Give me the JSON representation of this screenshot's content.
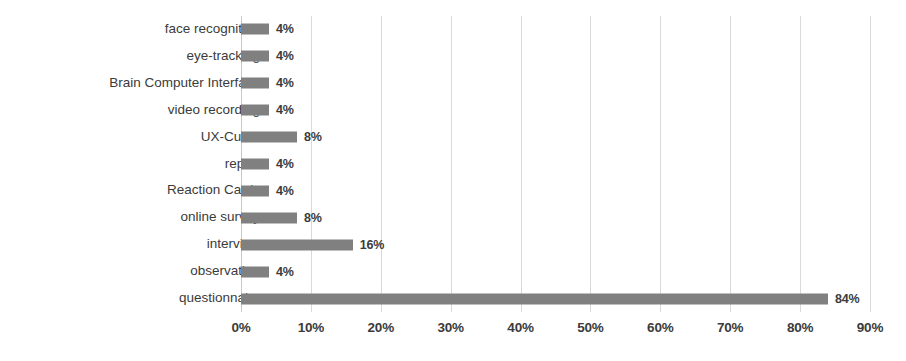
{
  "chart_data": {
    "type": "bar",
    "orientation": "horizontal",
    "title": "",
    "subtitle": "",
    "xlabel": "",
    "ylabel": "",
    "xlim": [
      0,
      90
    ],
    "xtick_step": 10,
    "grid": true,
    "legend": false,
    "legend_position": "none",
    "value_suffix": "%",
    "bar_color": "#808080",
    "gridline_color": "#d9d9d9",
    "background_color": "#ffffff",
    "text_color": "#3b3b3b",
    "categories": [
      "face recognition",
      "eye-tracking",
      "Brain Computer Interface",
      "video recording",
      "UX-Curve",
      "report",
      "Reaction Cards",
      "online survey",
      "interview",
      "observation",
      "questionnaire"
    ],
    "values": [
      4,
      4,
      4,
      4,
      8,
      4,
      4,
      8,
      16,
      4,
      84
    ],
    "value_labels": [
      "4%",
      "4%",
      "4%",
      "4%",
      "8%",
      "4%",
      "4%",
      "8%",
      "16%",
      "4%",
      "84%"
    ],
    "xticks": [
      0,
      10,
      20,
      30,
      40,
      50,
      60,
      70,
      80,
      90
    ],
    "xtick_labels": [
      "0%",
      "10%",
      "20%",
      "30%",
      "40%",
      "50%",
      "60%",
      "70%",
      "80%",
      "90%"
    ]
  }
}
